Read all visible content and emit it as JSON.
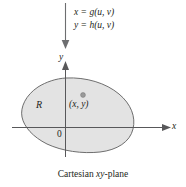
{
  "figure": {
    "caption_prefix": "Cartesian ",
    "caption_italic": "xy",
    "caption_suffix": "-plane",
    "caption_full": "Cartesian xy-plane"
  },
  "transformation": {
    "equation_x": "x = g(u, v)",
    "equation_y": "y = h(u, v)",
    "arrow_direction": "down"
  },
  "axes": {
    "x_label": "x",
    "y_label": "y",
    "origin_label": "0"
  },
  "region": {
    "label": "R",
    "point_label": "(x, y)",
    "fill_color": "#e3e3e3",
    "stroke_color": "#6e6e6e"
  },
  "colors": {
    "ink": "#231f20",
    "axis": "#58585a",
    "arrow": "#6d6e70",
    "region_fill": "#e3e3e3",
    "region_stroke": "#6e6e6e",
    "point_marker": "#8a8a8a"
  }
}
